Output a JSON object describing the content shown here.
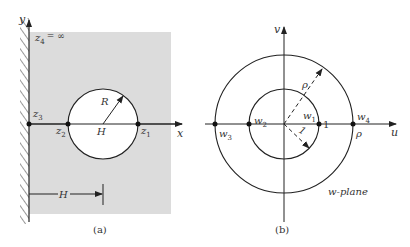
{
  "panel_a": {
    "caption": "(a)",
    "axis_x_label": "x",
    "axis_y_label": "y",
    "z4_label": "z",
    "z4_sub": "4",
    "z4_value": "= ∞",
    "z3_label": "z",
    "z3_sub": "3",
    "z2_label": "z",
    "z2_sub": "2",
    "z1_label": "z",
    "z1_sub": "1",
    "radius_label": "R",
    "center_label": "H",
    "distance_label": "H",
    "colors": {
      "shade": "#dcdcdc",
      "line": "#222222",
      "wall_hatch": "#333333"
    }
  },
  "panel_b": {
    "caption": "(b)",
    "axis_u_label": "u",
    "axis_v_label": "v",
    "plane_label": "w-plane",
    "w1_label": "w",
    "w1_sub": "1",
    "w2_label": "w",
    "w2_sub": "2",
    "w3_label": "w",
    "w3_sub": "3",
    "w4_label": "w",
    "w4_sub": "4",
    "inner_radius_label": "1",
    "inner_point_label": "1",
    "outer_radius_label": "ρ",
    "outer_point_label": "ρ",
    "colors": {
      "line": "#222222"
    }
  }
}
